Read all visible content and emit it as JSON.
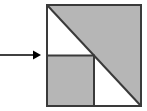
{
  "figure": {
    "title": "Square with diagonal and inscribed quarter square",
    "canvas": {
      "width": 147,
      "height": 111,
      "background": "#ffffff"
    },
    "colors": {
      "fill_gray": "#b6b6b6",
      "fill_white": "#ffffff",
      "stroke_dark": "#3a3a3a",
      "arrow": "#000000"
    },
    "outer_square": {
      "name": "outer-square",
      "x": 46,
      "y": 4,
      "width": 96,
      "height": 103,
      "fill": "#b6b6b6",
      "stroke": "#3a3a3a",
      "stroke_width": 2
    },
    "diagonal": {
      "name": "diagonal-line",
      "x1": 46,
      "y1": 4,
      "x2": 142,
      "y2": 107,
      "stroke": "#3a3a3a",
      "stroke_width": 2
    },
    "upper_left_triangle": {
      "name": "upper-left-white-triangle",
      "points": "46,4 46,55 94,55",
      "fill": "#ffffff"
    },
    "lower_right_triangle": {
      "name": "lower-right-white-triangle",
      "points": "94,55 142,107 94,107",
      "fill": "#ffffff"
    },
    "inner_square": {
      "name": "inner-square",
      "x": 46,
      "y": 55,
      "width": 48,
      "height": 52,
      "fill": "#b6b6b6",
      "stroke": "#3a3a3a",
      "stroke_width": 2
    },
    "arrow": {
      "name": "pointer-arrow",
      "line_x1": 0,
      "line_x2": 33,
      "line_y": 55,
      "head_points": "33,50 41,55 33,60",
      "stroke": "#000000",
      "stroke_width": 2,
      "label": ""
    }
  }
}
